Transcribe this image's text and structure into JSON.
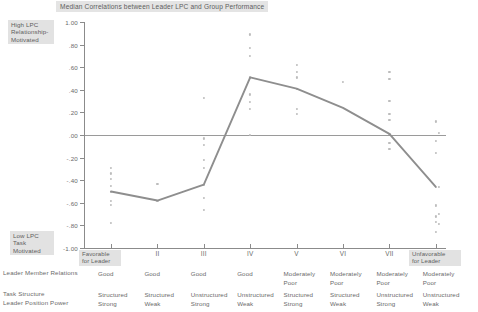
{
  "chart_data": {
    "type": "scatter",
    "title": "Median Correlations between Leader LPC and Group Performance",
    "xlabel": "",
    "ylabel": "",
    "ylim": [
      -1.0,
      1.0
    ],
    "grid": false,
    "legend": "none",
    "categories": [
      "I",
      "II",
      "III",
      "IV",
      "V",
      "VI",
      "VII",
      "VIII"
    ],
    "yticks": [
      "1.00",
      ".80",
      ".60",
      ".40",
      ".20",
      ".00",
      "-.20",
      "-.40",
      "-.60",
      "-.80",
      "-1.00"
    ],
    "ytick_values": [
      1.0,
      0.8,
      0.6,
      0.4,
      0.2,
      0.0,
      -0.2,
      -0.4,
      -0.6,
      -0.8,
      -1.0
    ],
    "series": [
      {
        "name": "Median correlation",
        "values": [
          -0.5,
          -0.58,
          -0.44,
          0.51,
          0.41,
          0.24,
          0.01,
          -0.46
        ]
      }
    ],
    "scatter_points": [
      {
        "category": "I",
        "values": [
          -0.29,
          -0.34,
          -0.39,
          -0.45,
          -0.5,
          -0.58,
          -0.62,
          -0.78
        ]
      },
      {
        "category": "II",
        "values": [
          -0.43,
          -0.58
        ]
      },
      {
        "category": "III",
        "values": [
          0.33,
          -0.03,
          -0.09,
          -0.22,
          -0.29,
          -0.44,
          -0.56,
          -0.66
        ]
      },
      {
        "category": "IV",
        "values": [
          0.89,
          0.77,
          0.7,
          0.51,
          0.36,
          0.29,
          0.23,
          0.0
        ]
      },
      {
        "category": "V",
        "values": [
          0.62,
          0.56,
          0.51,
          0.41,
          0.23,
          0.19
        ]
      },
      {
        "category": "VI",
        "values": [
          0.47
        ]
      },
      {
        "category": "VII",
        "values": [
          0.56,
          0.5,
          0.3,
          0.19,
          0.13,
          0.01,
          -0.07,
          -0.12
        ]
      },
      {
        "category": "VIII",
        "values": [
          0.12,
          0.02,
          -0.05,
          -0.16,
          -0.46,
          -0.62,
          -0.63,
          -0.7,
          -0.72,
          -0.77,
          -0.79,
          -0.86
        ]
      }
    ]
  },
  "annotations": {
    "top_left": "High LPC\nRelationship-\nMotivated",
    "top_left_lines": [
      "High LPC",
      "Relationship-",
      "Motivated"
    ],
    "bottom_left_lines": [
      "Low LPC",
      "Task",
      "Motivated"
    ],
    "favorable_lines": [
      "Favorable",
      "for Leader"
    ],
    "unfavorable_lines": [
      "Unfavorable",
      "for Leader"
    ]
  },
  "table": {
    "row_labels": [
      "Leader Member Relations",
      "Task Structure",
      "Leader Position Power"
    ],
    "columns": [
      {
        "octant": "I",
        "leader_member_relations": "Good",
        "task_structure": "Structured",
        "leader_position_power": "Strong"
      },
      {
        "octant": "II",
        "leader_member_relations": "Good",
        "task_structure": "Structured",
        "leader_position_power": "Weak"
      },
      {
        "octant": "III",
        "leader_member_relations": "Good",
        "task_structure": "Unstructured",
        "leader_position_power": "Strong"
      },
      {
        "octant": "IV",
        "leader_member_relations": "Good",
        "task_structure": "Unstructured",
        "leader_position_power": "Weak"
      },
      {
        "octant": "V",
        "leader_member_relations": "Moderately\nPoor",
        "task_structure": "Structured",
        "leader_position_power": "Strong"
      },
      {
        "octant": "VI",
        "leader_member_relations": "Moderately\nPoor",
        "task_structure": "Structured",
        "leader_position_power": "Weak"
      },
      {
        "octant": "VII",
        "leader_member_relations": "Moderately\nPoor",
        "task_structure": "Unstructured",
        "leader_position_power": "Strong"
      },
      {
        "octant": "VIII",
        "leader_member_relations": "Moderately\nPoor",
        "task_structure": "Unstructured",
        "leader_position_power": "Weak"
      }
    ]
  },
  "colors": {
    "line": "#8e8e8e",
    "dot": "#bcbcbc",
    "axis": "#8b8b8b",
    "text": "#6a6a6a",
    "highlight": "#e2e2e2",
    "background": "#ffffff"
  }
}
